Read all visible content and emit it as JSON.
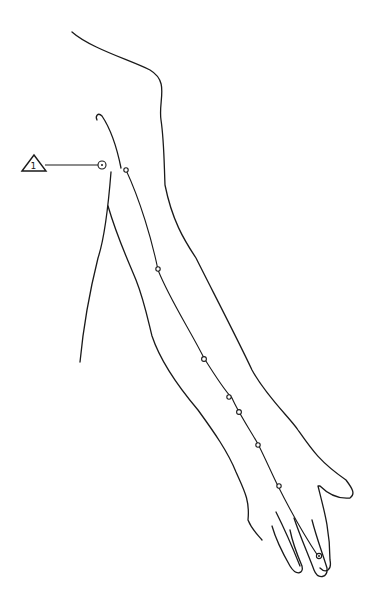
{
  "diagram": {
    "type": "anatomical-line-drawing",
    "colors": {
      "line": "#1a1a1a",
      "background": "#ffffff"
    },
    "marker": {
      "shape": "triangle",
      "label": "1"
    },
    "points_count": 10
  }
}
